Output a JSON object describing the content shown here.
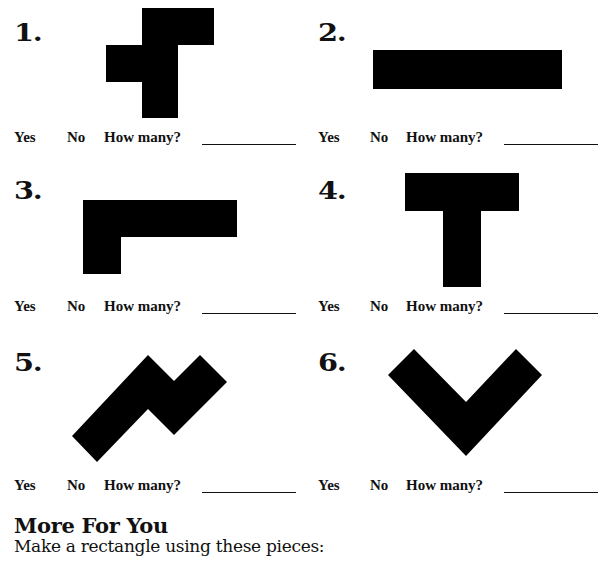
{
  "problems": [
    {
      "number": "1.",
      "yes": "Yes",
      "no": "No",
      "how_many": "How many?",
      "shape": "t-tetromino-tall-left-tab"
    },
    {
      "number": "2.",
      "yes": "Yes",
      "no": "No",
      "how_many": "How many?",
      "shape": "long-horizontal-bar"
    },
    {
      "number": "3.",
      "yes": "Yes",
      "no": "No",
      "how_many": "How many?",
      "shape": "l-shape"
    },
    {
      "number": "4.",
      "yes": "Yes",
      "no": "No",
      "how_many": "How many?",
      "shape": "t-shape"
    },
    {
      "number": "5.",
      "yes": "Yes",
      "no": "No",
      "how_many": "How many?",
      "shape": "rotated-zigzag"
    },
    {
      "number": "6.",
      "yes": "Yes",
      "no": "No",
      "how_many": "How many?",
      "shape": "v-shape"
    }
  ],
  "more": {
    "title": "More For You",
    "instruction": "Make a rectangle using these pieces:"
  },
  "colors": {
    "shape": "#000000",
    "text": "#111111",
    "background": "#ffffff"
  }
}
